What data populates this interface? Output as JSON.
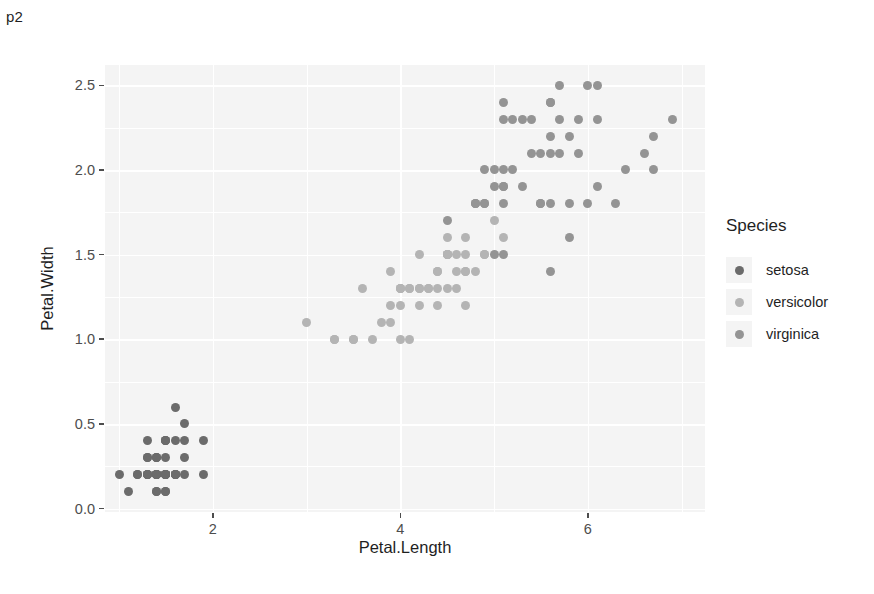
{
  "doc": {
    "label": "p2"
  },
  "chart_data": {
    "type": "scatter",
    "title": "",
    "xlabel": "Petal.Length",
    "ylabel": "Petal.Width",
    "xlim": [
      0.85,
      7.25
    ],
    "ylim": [
      -0.02,
      2.62
    ],
    "xticks": [
      "2",
      "4",
      "6"
    ],
    "xtick_values": [
      2,
      4,
      6
    ],
    "yticks": [
      "0.0",
      "0.5",
      "1.0",
      "1.5",
      "2.0",
      "2.5"
    ],
    "ytick_values": [
      0.0,
      0.5,
      1.0,
      1.5,
      2.0,
      2.5
    ],
    "grid": true,
    "grid_minor_x": [
      1,
      3,
      5,
      7
    ],
    "grid_minor_y": [
      0.25,
      0.75,
      1.25,
      1.75,
      2.25
    ],
    "legend": {
      "title": "Species",
      "position": "right",
      "entries": [
        {
          "label": "setosa",
          "color": "#6b6b6b"
        },
        {
          "label": "versicolor",
          "color": "#b4b4b4"
        },
        {
          "label": "virginica",
          "color": "#949494"
        }
      ]
    },
    "panel_background": "#f4f4f4",
    "grid_color": "#ffffff",
    "series": [
      {
        "name": "setosa",
        "color": "#6b6b6b",
        "x": [
          1.4,
          1.4,
          1.3,
          1.5,
          1.4,
          1.7,
          1.4,
          1.5,
          1.4,
          1.5,
          1.5,
          1.6,
          1.4,
          1.1,
          1.2,
          1.5,
          1.3,
          1.4,
          1.7,
          1.5,
          1.7,
          1.5,
          1.0,
          1.7,
          1.9,
          1.6,
          1.6,
          1.5,
          1.4,
          1.6,
          1.6,
          1.5,
          1.5,
          1.4,
          1.5,
          1.2,
          1.3,
          1.4,
          1.3,
          1.5,
          1.3,
          1.3,
          1.3,
          1.6,
          1.9,
          1.4,
          1.6,
          1.4,
          1.5,
          1.4
        ],
        "y": [
          0.2,
          0.2,
          0.2,
          0.2,
          0.2,
          0.4,
          0.3,
          0.2,
          0.2,
          0.1,
          0.2,
          0.2,
          0.1,
          0.1,
          0.2,
          0.4,
          0.4,
          0.3,
          0.3,
          0.3,
          0.2,
          0.4,
          0.2,
          0.5,
          0.2,
          0.2,
          0.4,
          0.2,
          0.2,
          0.2,
          0.2,
          0.4,
          0.1,
          0.2,
          0.2,
          0.2,
          0.2,
          0.1,
          0.2,
          0.2,
          0.3,
          0.3,
          0.2,
          0.6,
          0.4,
          0.3,
          0.2,
          0.2,
          0.2,
          0.2
        ]
      },
      {
        "name": "versicolor",
        "color": "#b4b4b4",
        "x": [
          4.7,
          4.5,
          4.9,
          4.0,
          4.6,
          4.5,
          4.7,
          3.3,
          4.6,
          3.9,
          3.5,
          4.2,
          4.0,
          4.7,
          3.6,
          4.4,
          4.5,
          4.1,
          4.5,
          3.9,
          4.8,
          4.0,
          4.9,
          4.7,
          4.3,
          4.4,
          4.8,
          5.0,
          4.5,
          3.5,
          3.8,
          3.7,
          3.9,
          5.1,
          4.5,
          4.5,
          4.7,
          4.4,
          4.1,
          4.0,
          4.4,
          4.6,
          4.0,
          3.3,
          4.2,
          4.2,
          4.2,
          4.3,
          3.0,
          4.1
        ],
        "y": [
          1.4,
          1.5,
          1.5,
          1.3,
          1.5,
          1.3,
          1.6,
          1.0,
          1.3,
          1.4,
          1.0,
          1.5,
          1.0,
          1.4,
          1.3,
          1.4,
          1.5,
          1.0,
          1.5,
          1.1,
          1.8,
          1.3,
          1.5,
          1.2,
          1.3,
          1.4,
          1.4,
          1.7,
          1.5,
          1.0,
          1.1,
          1.0,
          1.2,
          1.6,
          1.5,
          1.6,
          1.5,
          1.3,
          1.3,
          1.3,
          1.2,
          1.4,
          1.2,
          1.0,
          1.3,
          1.2,
          1.3,
          1.3,
          1.1,
          1.3
        ]
      },
      {
        "name": "virginica",
        "color": "#949494",
        "x": [
          6.0,
          5.1,
          5.9,
          5.6,
          5.8,
          6.6,
          4.5,
          6.3,
          5.8,
          6.1,
          5.1,
          5.3,
          5.5,
          5.0,
          5.1,
          5.3,
          5.5,
          6.7,
          6.9,
          5.0,
          5.7,
          4.9,
          6.7,
          4.9,
          5.7,
          6.0,
          4.8,
          4.9,
          5.6,
          5.8,
          6.1,
          6.4,
          5.6,
          5.1,
          5.6,
          6.1,
          5.6,
          5.5,
          4.8,
          5.4,
          5.6,
          5.1,
          5.1,
          5.9,
          5.7,
          5.2,
          5.0,
          5.2,
          5.4,
          5.1
        ],
        "y": [
          2.5,
          1.9,
          2.1,
          1.8,
          2.2,
          2.1,
          1.7,
          1.8,
          1.8,
          2.5,
          2.0,
          1.9,
          2.1,
          2.0,
          2.4,
          2.3,
          1.8,
          2.2,
          2.3,
          1.5,
          2.3,
          2.0,
          2.0,
          1.8,
          2.1,
          1.8,
          1.8,
          1.8,
          2.1,
          1.6,
          1.9,
          2.0,
          2.2,
          1.5,
          1.4,
          2.3,
          2.4,
          1.8,
          1.8,
          2.1,
          2.4,
          2.3,
          1.9,
          2.3,
          2.5,
          2.3,
          1.9,
          2.0,
          2.3,
          1.8
        ]
      }
    ]
  }
}
